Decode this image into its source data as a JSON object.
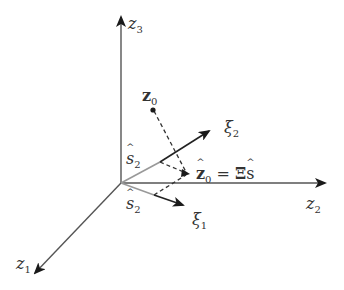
{
  "diagram": {
    "type": "3d-coordinate-projection",
    "colors": {
      "axis": "#333333",
      "gray_segment": "#999999",
      "dashed": "#333333",
      "background": "#ffffff"
    },
    "axes": {
      "z1": {
        "base": "z",
        "sub": "1"
      },
      "z2": {
        "base": "z",
        "sub": "2"
      },
      "z3": {
        "base": "z",
        "sub": "3"
      }
    },
    "vectors": {
      "xi1": {
        "base": "ξ",
        "sub": "1"
      },
      "xi2": {
        "base": "ξ",
        "sub": "2"
      }
    },
    "points": {
      "z0": {
        "base": "z",
        "sub": "0"
      },
      "z0_hat": {
        "base": "z",
        "sub": "0",
        "equation_rhs_op": " = ",
        "equation_rhs_matrix": "Ξ",
        "equation_rhs_vec": "s"
      }
    },
    "coefficient_labels": {
      "upper": {
        "base": "s",
        "sub": "2"
      },
      "lower": {
        "base": "s",
        "sub": "2"
      }
    }
  }
}
